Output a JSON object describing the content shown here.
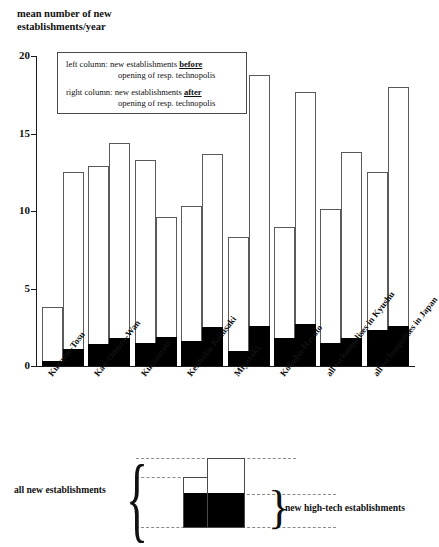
{
  "chart_data": {
    "type": "bar",
    "title": "mean number of new\nestablishments/year",
    "ylabel": "mean number of new establishments/year",
    "xlabel": "",
    "ylim": [
      0,
      20
    ],
    "yticks": [
      0,
      5,
      10,
      15,
      20
    ],
    "grid": false,
    "legend_position": "inside-top-left",
    "categories": [
      "Kurume-Tosu",
      "Kan-Omura-Wan",
      "Kumamoto",
      "Kenhoku-Kunisaki",
      "Miyazaki",
      "Kokubu-Hayato",
      "all technopolises in Kyushu",
      "all technopolises in Japan"
    ],
    "series": [
      {
        "name": "left column: new establishments before opening of resp. technopolis",
        "key": "before",
        "total_values": [
          3.8,
          12.9,
          13.3,
          10.3,
          8.3,
          9.0,
          10.1,
          12.5
        ],
        "hightech_values": [
          0.3,
          1.4,
          1.5,
          1.6,
          1.0,
          1.8,
          1.5,
          2.3
        ]
      },
      {
        "name": "right column: new establishments after opening of resp. technopolis",
        "key": "after",
        "total_values": [
          12.5,
          14.4,
          9.6,
          13.7,
          18.8,
          17.7,
          13.8,
          18.0
        ],
        "hightech_values": [
          1.1,
          1.8,
          1.9,
          2.5,
          2.6,
          2.7,
          1.8,
          2.6
        ]
      }
    ],
    "segment_legend": {
      "filled": "new high-tech establishments",
      "whole": "all new establishments"
    }
  },
  "legend_box": {
    "line1_prefix": "left column: new establishments",
    "line1_emphasis": "before",
    "line1_cont": "opening of resp. technopolis",
    "line2_prefix": "right column: new establishments",
    "line2_emphasis": "after",
    "line2_cont": "opening of resp. technopolis"
  },
  "bottom_diagram": {
    "left_label": "all new establishments",
    "right_label": "new high-tech establishments",
    "left_brace": "{",
    "right_brace": "}"
  },
  "colors": {
    "fill_hightech": "#000000",
    "fill_total": "#ffffff",
    "outline": "#4a4a4a",
    "axis": "#1a1a1a",
    "dash": "#8a8a8a",
    "text": "#111111"
  }
}
